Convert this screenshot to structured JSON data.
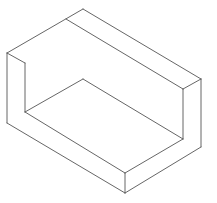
{
  "figure": {
    "stroke_color": "#555555",
    "background": "#ffffff"
  },
  "vertices": {
    "top_back": [
      83,
      9
    ],
    "ridge_left": [
      66,
      19
    ],
    "left_top": [
      7,
      53
    ],
    "inner_left_top": [
      25,
      63
    ],
    "back_floor": [
      83,
      79
    ],
    "left_bottom": [
      7,
      123
    ],
    "inner_left_floor": [
      25,
      112
    ],
    "right_top": [
      201,
      79
    ],
    "inner_right_top": [
      183,
      89
    ],
    "inner_right_floor": [
      183,
      139
    ],
    "right_bottom": [
      201,
      147
    ],
    "front_top": [
      125,
      173
    ],
    "front_bottom": [
      125,
      193
    ]
  }
}
